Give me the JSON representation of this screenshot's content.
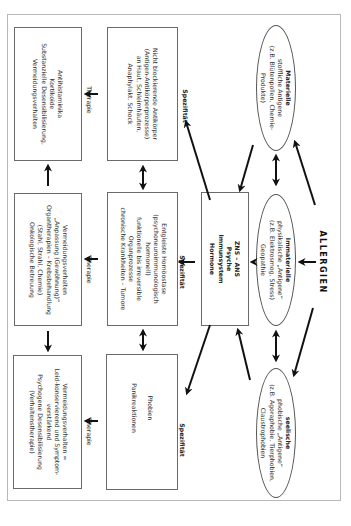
{
  "diagram": {
    "title": "ALLERGIEN",
    "orientation": "rotated 90° clockwise",
    "allergen_types": [
      {
        "id": "materielle",
        "heading": "Materielle",
        "lines": [
          "stoffliche Antigene",
          "(z.B. Blütenpollen, Chemie-",
          "Produkte)"
        ]
      },
      {
        "id": "immaterielle",
        "heading": "Immaterielle",
        "lines": [
          "physikalische „Antigene“",
          "(z.B. Elektrosmog, Stress)",
          "Geopathie"
        ]
      },
      {
        "id": "seelische",
        "heading": "seelische",
        "lines": [
          "phobische „Antigene“",
          "(z.B. Agoraphobie, Tierphobien,",
          "Claustrophobien"
        ]
      }
    ],
    "center_box": {
      "lines": [
        "ZNS – ANS",
        "Psyche",
        "Immunsystem",
        "Hormone"
      ]
    },
    "edge_labels": {
      "specificity": "Spezifität",
      "therapy": "Therapie"
    },
    "reaction_boxes": [
      {
        "id": "reaction-materielle",
        "lines": [
          "Nicht blockierende Antikörper",
          "(Antigen-Antikörperprozesse)",
          "an Haut, Schleimhäuten,",
          "Anaphylakt. Schock"
        ]
      },
      {
        "id": "reaction-immaterielle",
        "lines": [
          "Entgleiste Homöostase",
          "(psychoneuroimmunologisch",
          "hormonell)",
          "funktionelle bis irreversible",
          "Organprozesse",
          "chronische Krankheiten – Tumore"
        ]
      },
      {
        "id": "reaction-seelische",
        "lines": [
          "Phobien",
          "",
          "Panikreaktionen"
        ]
      }
    ],
    "therapy_boxes": [
      {
        "id": "therapy-materielle",
        "lines": [
          "Antihistaminika",
          "Kortikoide",
          "Substanzielle Desensibilisierung,",
          "Vermeidungsverhalten"
        ]
      },
      {
        "id": "therapy-immaterielle",
        "lines": [
          "Vermeidungsverhalten",
          "„Anpassung (Gewöhnung)“",
          "Organtherapien – Krebsbehandlung",
          "(Stahl, Strahl, Chemie)",
          "Onkologische Betreuung"
        ]
      },
      {
        "id": "therapy-seelische",
        "lines": [
          "Vermeidungsverhalten =",
          "Leid-konservierend und Symptom-",
          "verstärkend",
          "Psychogene Desensibilisierung",
          "(Verhaltenstherapie)"
        ]
      }
    ]
  }
}
